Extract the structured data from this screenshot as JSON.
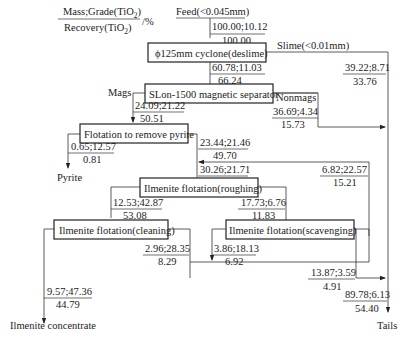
{
  "legend": {
    "numerator": "Mass;Grade(TiO",
    "numerator_sub": "2",
    "numerator_end": ")",
    "denominator": "Recovery(TiO",
    "denominator_sub": "2",
    "denominator_end": ")",
    "unit": "/%"
  },
  "feed": {
    "label": "Feed(<0.045mm)",
    "top": "100.00;10.12",
    "bottom": "100.00"
  },
  "units": {
    "cyclone": "ϕ125mm cyclone(deslime)",
    "magnetic": "SLon-1500 magnetic separator",
    "pyrite_flotation": "Flotation to remove pyrite",
    "roughing": "Ilmenite flotation(roughing)",
    "cleaning": "Ilmenite flotation(cleaning)",
    "scavenging": "Ilmenite flotation(scavenging)"
  },
  "streams": {
    "slime": {
      "label": "Slime(<0.01mm)",
      "top": "39.22;8.71",
      "bottom": "33.76"
    },
    "cyclone_underflow": {
      "top": "60.78;11.03",
      "bottom": "66.24"
    },
    "mags": {
      "label": "Mags",
      "top": "24.09;21.22",
      "bottom": "50.51"
    },
    "nonmags": {
      "label": "Nonmags",
      "top": "36.69;4.34",
      "bottom": "15.73"
    },
    "pyrite": {
      "label": "Pyrite",
      "top": "0.65;12.57",
      "bottom": "0.81"
    },
    "pyrite_tails": {
      "top": "23.44;21.46",
      "bottom": "49.70"
    },
    "rougher_feed": {
      "top": "30.26;21.71",
      "bottom": "64.91"
    },
    "scav_conc": {
      "top": "6.82;22.57",
      "bottom": "15.21"
    },
    "rougher_conc": {
      "top": "12.53;42.87",
      "bottom": "53.08"
    },
    "rougher_tails": {
      "top": "17.73;6.76",
      "bottom": "11.83"
    },
    "cleaner_tails": {
      "top": "2.96;28.35",
      "bottom": "8.29"
    },
    "scav_middlings": {
      "top": "3.86;18.13",
      "bottom": "6.92"
    },
    "scav_tails": {
      "top": "13.87;3.59",
      "bottom": "4.91"
    },
    "concentrate": {
      "label": "Ilmenite concentrate",
      "top": "9.57;47.36",
      "bottom": "44.79"
    },
    "tails": {
      "label": "Tails",
      "top": "89.78;6.13",
      "bottom": "54.40"
    }
  }
}
